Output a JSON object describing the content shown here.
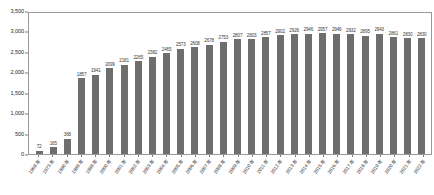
{
  "chart_data": {
    "type": "bar",
    "title": "",
    "xlabel": "",
    "ylabel": "",
    "ylim": [
      0,
      3500
    ],
    "ytick_labels": [
      "3,500",
      "3,000",
      "2,500",
      "2,000",
      "1,500",
      "1,000",
      "500",
      "0"
    ],
    "ytick_values": [
      3500,
      3000,
      2500,
      2000,
      1500,
      1000,
      500,
      0
    ],
    "grid": false,
    "legend": "none",
    "bar_color": "#6e6e6e",
    "axis_color": "#9a9a9a",
    "categories": [
      "1968 年",
      "1973 年",
      "1980 年",
      "1989 年",
      "1998 年",
      "2000 年",
      "2001 年",
      "2002 年",
      "2003 年",
      "2004 年",
      "2005 年",
      "2006 年",
      "2007 年",
      "2008 年",
      "2009 年",
      "2010 年",
      "2011 年",
      "2012 年",
      "2013 年",
      "2014 年",
      "2015 年",
      "2016 年",
      "2017 年",
      "2018 年",
      "2019 年",
      "2020 年",
      "2021 年",
      "2022 年"
    ],
    "values": [
      72,
      165,
      368,
      1857,
      1941,
      2099,
      2181,
      2265,
      2382,
      2465,
      2573,
      2608,
      2678,
      2753,
      2807,
      2803,
      2857,
      2902,
      2926,
      2946,
      2957,
      2946,
      2932,
      2895,
      2943,
      2861,
      2830,
      2830
    ],
    "value_labels": [
      "72",
      "165",
      "368",
      "1857",
      "1941",
      "2099",
      "2181",
      "2265",
      "2382",
      "2465",
      "2573",
      "2608",
      "2678",
      "2753",
      "2807",
      "2803",
      "2857",
      "2902",
      "2926",
      "2946",
      "2957",
      "2946",
      "2932",
      "2895",
      "2943",
      "2861",
      "2830",
      "2830"
    ]
  }
}
